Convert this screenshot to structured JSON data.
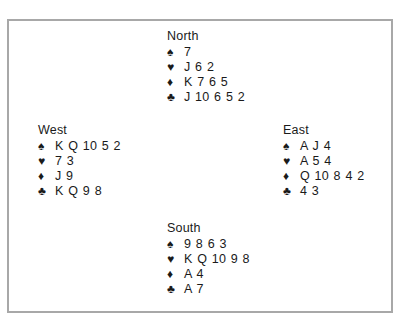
{
  "hands": {
    "north": {
      "seat": "North",
      "spades": "7",
      "hearts": "J 6 2",
      "diamonds": "K 7 6 5",
      "clubs": "J 10 6 5 2"
    },
    "west": {
      "seat": "West",
      "spades": "K Q 10 5 2",
      "hearts": "7 3",
      "diamonds": "J 9",
      "clubs": "K Q 9 8"
    },
    "east": {
      "seat": "East",
      "spades": "A J 4",
      "hearts": "A 5 4",
      "diamonds": "Q 10 8 4 2",
      "clubs": "4 3"
    },
    "south": {
      "seat": "South",
      "spades": "9 8 6 3",
      "hearts": "K Q 10 9 8",
      "diamonds": "A 4",
      "clubs": "A 7"
    }
  },
  "suit_symbols": {
    "spades": "♠",
    "hearts": "♥",
    "diamonds": "♦",
    "clubs": "♣"
  }
}
